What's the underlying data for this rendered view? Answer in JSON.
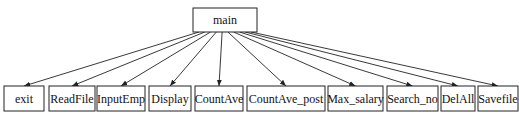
{
  "diagram": {
    "type": "call-tree",
    "root": {
      "id": "main",
      "label": "main",
      "x": 193,
      "y": 8,
      "w": 64,
      "h": 24
    },
    "children": [
      {
        "id": "exit",
        "label": "exit",
        "x": 4,
        "y": 86,
        "w": 40,
        "h": 25
      },
      {
        "id": "readfile",
        "label": "ReadFile",
        "x": 49,
        "y": 86,
        "w": 46,
        "h": 25
      },
      {
        "id": "inputemp",
        "label": "InputEmp",
        "x": 97,
        "y": 86,
        "w": 48,
        "h": 25
      },
      {
        "id": "display",
        "label": "Display",
        "x": 149,
        "y": 86,
        "w": 42,
        "h": 25
      },
      {
        "id": "countave",
        "label": "CountAve",
        "x": 195,
        "y": 86,
        "w": 48,
        "h": 25
      },
      {
        "id": "countave-post",
        "label": "CountAve_post",
        "x": 247,
        "y": 86,
        "w": 78,
        "h": 25
      },
      {
        "id": "max-salary",
        "label": "Max_salary",
        "x": 328,
        "y": 86,
        "w": 55,
        "h": 25
      },
      {
        "id": "search-no",
        "label": "Search_no",
        "x": 387,
        "y": 86,
        "w": 51,
        "h": 25
      },
      {
        "id": "delall",
        "label": "DelAll",
        "x": 441,
        "y": 86,
        "w": 34,
        "h": 25
      },
      {
        "id": "savefile",
        "label": "Savefile",
        "x": 478,
        "y": 86,
        "w": 40,
        "h": 25
      }
    ],
    "edges": [
      {
        "from": "main",
        "to": "exit"
      },
      {
        "from": "main",
        "to": "ReadFile"
      },
      {
        "from": "main",
        "to": "InputEmp"
      },
      {
        "from": "main",
        "to": "Display"
      },
      {
        "from": "main",
        "to": "CountAve"
      },
      {
        "from": "main",
        "to": "CountAve_post"
      },
      {
        "from": "main",
        "to": "Max_salary"
      },
      {
        "from": "main",
        "to": "Search_no"
      },
      {
        "from": "main",
        "to": "DelAll"
      },
      {
        "from": "main",
        "to": "Savefile"
      }
    ],
    "colors": {
      "stroke": "#222222",
      "fill": "#ffffff",
      "text": "#111111"
    }
  }
}
